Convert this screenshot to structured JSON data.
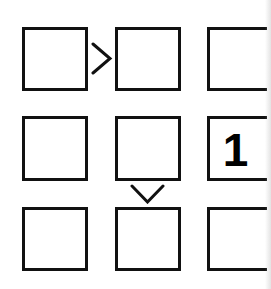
{
  "puzzle": {
    "type": "futoshiki-like inequality grid",
    "rows": 3,
    "cols": 3,
    "cells": [
      [
        "",
        "",
        ""
      ],
      [
        "",
        "",
        "1"
      ],
      [
        "",
        "",
        ""
      ]
    ],
    "constraints": [
      {
        "between": "r1c1-r1c2",
        "symbol": ">"
      },
      {
        "between": "r2c2-r3c2",
        "symbol": "v"
      }
    ]
  },
  "colors": {
    "border": "#111111",
    "background": "#ffffff",
    "text": "#000000"
  }
}
